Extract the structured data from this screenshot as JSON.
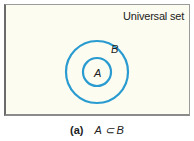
{
  "diagram": {
    "type": "venn",
    "universe_label": "Universal set",
    "sets": [
      {
        "name": "B",
        "label": "B",
        "role": "outer circle (superset)"
      },
      {
        "name": "A",
        "label": "A",
        "role": "inner circle (subset)"
      }
    ],
    "relation": "A is a subset of B",
    "colors": {
      "circle_stroke": "#2a9bd1",
      "background": "#fcfcf0",
      "border": "#7a7a7a"
    }
  },
  "caption": {
    "tag": "(a)",
    "expression": "A ⊂ B"
  }
}
